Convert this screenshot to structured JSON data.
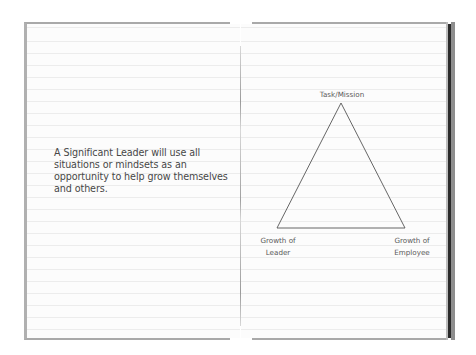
{
  "notebook": {
    "left_page": {
      "quote": "A Significant Leader will use all situations or mindsets as an opportunity to help grow themselves and others."
    },
    "right_page": {
      "diagram": {
        "type": "triangle",
        "vertices": {
          "top": {
            "label": "Task/Mission"
          },
          "bottom_left": {
            "label_line1": "Growth of",
            "label_line2": "Leader"
          },
          "bottom_right": {
            "label_line1": "Growth of",
            "label_line2": "Employee"
          }
        },
        "stroke_color": "#555555"
      }
    }
  },
  "colors": {
    "page": "#fcfcfc",
    "rule_line": "#ececec",
    "border": "#a9a9a9",
    "cover_dark": "#2a2a2a",
    "text": "#474747"
  }
}
